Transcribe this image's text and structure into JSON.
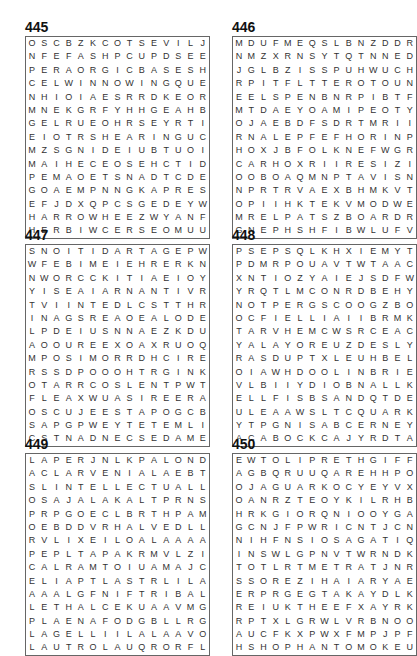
{
  "puzzles": [
    {
      "number": "445",
      "rows": [
        "OSCBZKCOTSEVILJ",
        "NFEFASHPCUPDSEE",
        "PERAORGICBASESH",
        "CELWINNOWINGQUE",
        "NHIOIAESRRDKEOR",
        "MNEKGRFYHHGEAHB",
        "GELRUEOHRSEYRTI",
        "EIOTRSHEARINGUC",
        "MZSGNIDEIUBTUOI",
        "MAIHECEOSEHCTID",
        "PEMAOETSNADTCDE",
        "GOAEMPNNGKAPRES",
        "EFJDXQPCSGEDEYW",
        "HARROWHEEZWYANF",
        "HERBIWCERSEOMUU"
      ]
    },
    {
      "number": "446",
      "rows": [
        "MDUFMEQSLBNZDDR",
        "NMZXRNSYTQTNNED",
        "JGLBZISSPUHWUCH",
        "RPITFLTTEROTOUN",
        "EELSPENBNRPIBTF",
        "MTDAEYOAMIPEOTY",
        "OJAEBDFSDRTMRII",
        "RNALEPFEFHORINP",
        "HOXJBFOLKNEFWGR",
        "CARHOXRIIRESIZI",
        "OOBOAQMNPTAVISN",
        "NPRTRVAEXBHMKVT",
        "OPIIHKTEKVMODWE",
        "MRELPATSZBOARDR",
        "GNEPHSHFIBWLUFV"
      ]
    },
    {
      "number": "447",
      "rows": [
        "SNOITIDARTAGEPW",
        "WFEBIMEIEHRERKN",
        "NWORCCKITIAEIOY",
        "YISEAIARNANTIVR",
        "TVIINTEDLCSTTHR",
        "INAGSREAOEALODE",
        "LPDEIUSNNAEZKDU",
        "AOOUREEXOAXRUOQ",
        "MPOSIMORRDHCIRE",
        "RSSDPOOOHTRGINK",
        "OTARRCOSLENTPWT",
        "FLEAXWUASIREERA",
        "OSCUJEESTAPOGCB",
        "SAPGPWEYTETEMLI",
        "CSTNADNECSEDAME"
      ]
    },
    {
      "number": "448",
      "rows": [
        "PSEPSQLKHXIEMYT",
        "PDMRPOUAVTWTAAC",
        "XNTIOZYAIEJSDFW",
        "YRQTLMCONRDBEHY",
        "NOTPERGSCOOGZBO",
        "OCFIELLIAIIBRMK",
        "TARVHEMCWSRCEAC",
        "YALAYOREUZDESLY",
        "RASDUPTXLEUHBEL",
        "OIAWHDOOLINBRIE",
        "VLBIIYDIOBNALLK",
        "ELLFISBSANDQTDE",
        "ULEAAWSLTCQUARK",
        "YTPGNISABCERNEY",
        "ACABOCKCAJYRDTA"
      ]
    },
    {
      "number": "449",
      "rows": [
        "LAPERJNLKPALOND",
        "ACLARVENIALAEBT",
        "SLINTELLECTUALL",
        "OSAJALAKALTPRNS",
        "PRPGOECLBRTHPAM",
        "OEBDDVRHALVEDLL",
        "RVLIXEILOALAAAA",
        "PEPLTAPAKRMVLZI",
        "CALRAMTOIUAMAJC",
        "ELIAPTLASTRLILA",
        "AAALGFNIFTRIBAL",
        "LETHALCEKUAAVMG",
        "PLAENAFODGBLLRG",
        "LAGELLIILALAAVOA",
        "LAUTROLAUQRORFL"
      ]
    },
    {
      "number": "450",
      "rows": [
        "EWTOLIPRETHGIFF",
        "AGBQRUUQAREHHPO",
        "OJAGUARKOCYEYVX",
        "OANRZTEOYKILRHB",
        "HRKGIORQNIOOYGA",
        "GCNJFPWRICNTJCNT",
        "NIHFNSIOSAGATIQ",
        "INSWLGPNVTWRNDK",
        "TOTLRTMETRATJNR",
        "SSOREZIHAIARYAE",
        "ERPRGEGTAKAYDLK",
        "REIUKTHEEFXAYRK",
        "RPTXLGRWLVRBNOO",
        "AUCFKXPWXFMPJPF",
        "HSHOPHANTOMOKEU"
      ]
    }
  ]
}
